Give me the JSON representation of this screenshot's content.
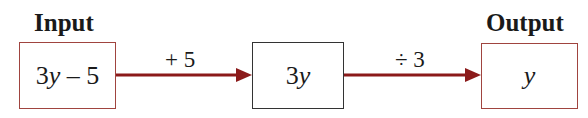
{
  "labels": {
    "input": "Input",
    "output": "Output"
  },
  "boxes": [
    {
      "id": "input",
      "coef": "3",
      "var": "y",
      "rest": " – 5",
      "border": "#a0443f"
    },
    {
      "id": "middle",
      "coef": "3",
      "var": "y",
      "rest": "",
      "border": "#333333"
    },
    {
      "id": "output",
      "coef": "",
      "var": "y",
      "rest": "",
      "border": "#a0443f"
    }
  ],
  "operations": [
    {
      "label": "+ 5"
    },
    {
      "label": "÷ 3"
    }
  ],
  "colors": {
    "arrow": "#8b1a1a",
    "input_border": "#a0443f",
    "middle_border": "#333333"
  }
}
